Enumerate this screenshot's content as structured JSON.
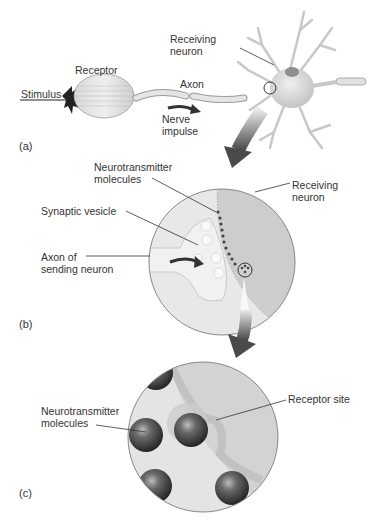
{
  "panel_a": {
    "part_label": "(a)",
    "labels": {
      "stimulus": "Stimulus",
      "receptor": "Receptor",
      "axon": "Axon",
      "nerve_impulse_1": "Nerve",
      "nerve_impulse_2": "impulse",
      "receiving_neuron_1": "Receiving",
      "receiving_neuron_2": "neuron"
    }
  },
  "panel_b": {
    "part_label": "(b)",
    "labels": {
      "neurotransmitter_1": "Neurotransmitter",
      "neurotransmitter_2": "molecules",
      "receiving_neuron_1": "Receiving",
      "receiving_neuron_2": "neuron",
      "synaptic_vesicle": "Synaptic vesicle",
      "axon_sending_1": "Axon of",
      "axon_sending_2": "sending neuron"
    }
  },
  "panel_c": {
    "part_label": "(c)",
    "labels": {
      "neurotransmitter_1": "Neurotransmitter",
      "neurotransmitter_2": "molecules",
      "receptor_site": "Receptor site"
    }
  },
  "colors": {
    "background": "#ffffff",
    "text": "#333333",
    "arrow_dark": "#555555",
    "tissue_light": "#e6e6e6",
    "tissue_mid": "#cfcfcf",
    "molecule_dark": "#3a3a3a"
  }
}
